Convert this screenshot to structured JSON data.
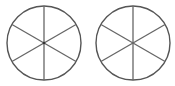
{
  "diagram": {
    "background": "#ffffff",
    "stroke_color": "#555555",
    "shapes": [
      {
        "name": "left-circle",
        "cx": 44,
        "cy": 43,
        "r": 37,
        "sectors": 6,
        "spoke_angles_deg": [
          90,
          30,
          -30,
          -90,
          -150,
          150
        ],
        "hub_dot": true
      },
      {
        "name": "right-circle",
        "cx": 133,
        "cy": 43,
        "r": 37,
        "sectors": 6,
        "spoke_angles_deg": [
          90,
          30,
          -30,
          -90,
          -150,
          150
        ],
        "hub_dot": false
      }
    ]
  }
}
